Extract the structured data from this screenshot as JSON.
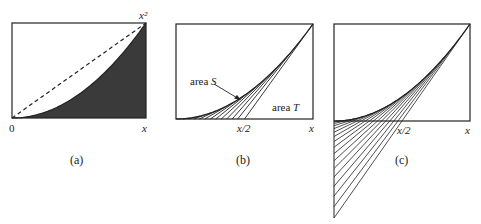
{
  "panels": [
    {
      "id": "a",
      "caption": "(a)",
      "labels": {
        "origin": "0",
        "x_axis": "x",
        "top_right": "x²"
      },
      "box": {
        "x0": 12,
        "y0": 23,
        "x1": 146,
        "y1": 118
      },
      "features": [
        "parabola y=x^2",
        "dashed chord from origin to (x, x^2)",
        "filled region under parabola"
      ]
    },
    {
      "id": "b",
      "caption": "(b)",
      "labels": {
        "mid": "x/2",
        "x_axis": "x",
        "area_s_prefix": "area ",
        "area_s_var": "S",
        "area_t_prefix": "area ",
        "area_t_var": "T"
      },
      "box": {
        "x0": 176,
        "y0": 24,
        "x1": 313,
        "y1": 119
      },
      "tangent_points": [
        0.1,
        0.18,
        0.26,
        0.34,
        0.42,
        0.5,
        0.58,
        0.66,
        0.74,
        0.82,
        0.9,
        1.0
      ],
      "tangent_clip": "bottom-edge"
    },
    {
      "id": "c",
      "caption": "(c)",
      "labels": {
        "mid": "x/2",
        "x_axis": "x"
      },
      "box": {
        "x0": 334,
        "y0": 24,
        "x1": 470,
        "y1": 121
      },
      "tangent_points": [
        0.1,
        0.16,
        0.22,
        0.28,
        0.34,
        0.4,
        0.46,
        0.52,
        0.58,
        0.64,
        0.7,
        0.76,
        0.82,
        0.88,
        0.94,
        1.0
      ],
      "tangent_clip": "left-edge"
    }
  ],
  "colors": {
    "ink": "#222222",
    "fill": "#3a3a3a"
  }
}
